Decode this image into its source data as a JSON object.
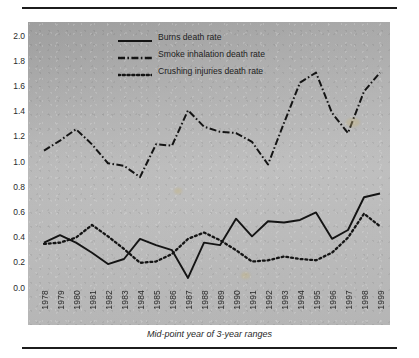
{
  "figure": {
    "rules": {
      "top": "horizontal-rule",
      "bottom": "horizontal-rule"
    }
  },
  "legend": {
    "position": "inside-top-center",
    "items": [
      {
        "label": "Burns death rate",
        "style": "solid",
        "key": "burns-line-key"
      },
      {
        "label": "Smoke inhalation death rate",
        "style": "dash-dot",
        "key": "smoke-line-key"
      },
      {
        "label": "Crushing injuries death rate",
        "style": "dotted",
        "key": "crushing-line-key"
      }
    ]
  },
  "axes": {
    "x_caption": "Mid-point year of 3-year ranges",
    "y_ticks": [
      "2.0",
      "1.8",
      "1.6",
      "1.4",
      "1.2",
      "1.0",
      "0.8",
      "0.6",
      "0.4",
      "0.2",
      "0.0"
    ],
    "x_ticks": [
      "1978",
      "1979",
      "1980",
      "1981",
      "1982",
      "1983",
      "1984",
      "1985",
      "1986",
      "1987",
      "1988",
      "1989",
      "1990",
      "1991",
      "1992",
      "1993",
      "1994",
      "1995",
      "1996",
      "1997",
      "1998",
      "1999"
    ]
  },
  "chart_data": {
    "type": "line",
    "title": "",
    "subtitle": "",
    "xlabel": "Mid-point year of 3-year ranges",
    "ylabel": "",
    "xlim": [
      1978,
      1999
    ],
    "ylim": [
      0.0,
      2.0
    ],
    "ytick_step": 0.2,
    "grid": false,
    "legend_position": "inside-top-center",
    "x": [
      1978,
      1979,
      1980,
      1981,
      1982,
      1983,
      1984,
      1985,
      1986,
      1987,
      1988,
      1989,
      1990,
      1991,
      1992,
      1993,
      1994,
      1995,
      1996,
      1997,
      1998,
      1999
    ],
    "categories": [
      "1978",
      "1979",
      "1980",
      "1981",
      "1982",
      "1983",
      "1984",
      "1985",
      "1986",
      "1987",
      "1988",
      "1989",
      "1990",
      "1991",
      "1992",
      "1993",
      "1994",
      "1995",
      "1996",
      "1997",
      "1998",
      "1999"
    ],
    "series": [
      {
        "name": "Burns death rate",
        "style": "solid",
        "color": "#141414",
        "values": [
          0.36,
          0.42,
          0.36,
          0.28,
          0.19,
          0.23,
          0.39,
          0.34,
          0.3,
          0.08,
          0.36,
          0.34,
          0.55,
          0.41,
          0.53,
          0.52,
          0.54,
          0.6,
          0.39,
          0.46,
          0.72,
          0.75
        ]
      },
      {
        "name": "Smoke inhalation death rate",
        "style": "dash-dot",
        "color": "#141414",
        "values": [
          1.09,
          1.17,
          1.26,
          1.14,
          0.99,
          0.97,
          0.88,
          1.14,
          1.13,
          1.41,
          1.28,
          1.24,
          1.23,
          1.16,
          0.98,
          1.31,
          1.63,
          1.71,
          1.39,
          1.23,
          1.56,
          1.71
        ]
      },
      {
        "name": "Crushing injuries death rate",
        "style": "dotted",
        "color": "#141414",
        "values": [
          0.35,
          0.36,
          0.4,
          0.5,
          0.41,
          0.31,
          0.2,
          0.21,
          0.27,
          0.39,
          0.44,
          0.38,
          0.3,
          0.21,
          0.22,
          0.25,
          0.23,
          0.22,
          0.28,
          0.4,
          0.59,
          0.49
        ]
      }
    ]
  }
}
